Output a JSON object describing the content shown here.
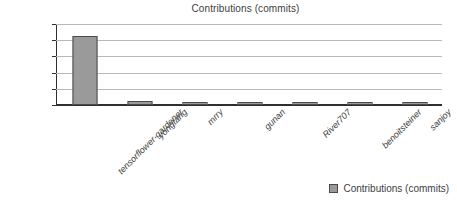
{
  "chart_data": {
    "type": "bar",
    "title": "Contributions (commits)",
    "xlabel": "",
    "ylabel": "",
    "categories": [
      "tensorflower-gardener",
      "yongtang",
      "mrry",
      "gunan",
      "River707",
      "benoitsteiner",
      "sanjoy"
    ],
    "values": [
      21300,
      1200,
      1050,
      950,
      800,
      600,
      550
    ],
    "series": [
      {
        "name": "Contributions (commits)",
        "values": [
          21300,
          1200,
          1050,
          950,
          800,
          600,
          550
        ]
      }
    ],
    "ylim": [
      0,
      25000
    ],
    "yticks": [
      0,
      5000,
      10000,
      15000,
      20000,
      25000
    ],
    "ytick_labels": [
      "0",
      "5,000",
      "10,000",
      "15,000",
      "20,000",
      "25,000"
    ],
    "grid": true,
    "legend_position": "bottom-right",
    "bar_color": "#9a9a9a",
    "bar_border_color": "#4a4a4a",
    "gridline_color": "#b9b9b9",
    "axis_color": "#2f2f2f"
  },
  "legend": {
    "entries": [
      {
        "label": "Contributions (commits)",
        "color": "#9a9a9a"
      }
    ]
  }
}
